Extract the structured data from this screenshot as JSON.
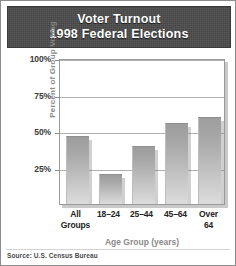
{
  "title": {
    "line1": "Voter Turnout",
    "line2": "1998 Federal Elections"
  },
  "source_note": "Source: U.S. Census Bureau",
  "axis": {
    "y_title": "Percent of Group Voting",
    "x_title": "Age Group (years)",
    "y_ticks": [
      "100%",
      "75%",
      "50%",
      "25%"
    ]
  },
  "x_labels": [
    {
      "line1": "All",
      "line2": "Groups"
    },
    {
      "line1": "18–24",
      "line2": ""
    },
    {
      "line1": "25–44",
      "line2": ""
    },
    {
      "line1": "45–64",
      "line2": ""
    },
    {
      "line1": "Over",
      "line2": "64"
    }
  ],
  "colors": {
    "banner_background": "#4b4b4b",
    "banner_text": "#ffffff",
    "bar_top": "#9d9d9d",
    "bar_bottom": "#dcdcdc",
    "gridline": "#b0b0b0",
    "frame": "#9a9a9a",
    "axis_title_text": "#8a8a8a",
    "tick_text": "#3a3a3a"
  },
  "chart_data": {
    "type": "bar",
    "title": "Voter Turnout 1998 Federal Elections",
    "subtitle": "",
    "xlabel": "Age Group (years)",
    "ylabel": "Percent of Group Voting",
    "categories": [
      "All Groups",
      "18-24",
      "25-44",
      "45-64",
      "Over 64"
    ],
    "values": [
      46,
      20,
      39,
      55,
      59
    ],
    "ylim": [
      0,
      100
    ],
    "ytick_values": [
      25,
      50,
      75,
      100
    ],
    "ytick_labels": [
      "25%",
      "50%",
      "75%",
      "100%"
    ],
    "grid": true,
    "legend": false,
    "source": "Source: U.S. Census Bureau"
  }
}
